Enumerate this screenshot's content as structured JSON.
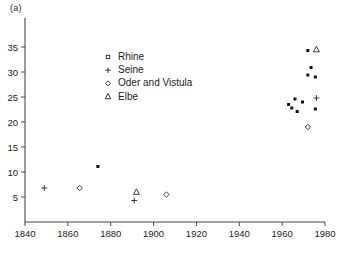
{
  "panel": {
    "label": "(a)"
  },
  "chart_data": {
    "type": "scatter",
    "title": "",
    "xlabel": "",
    "ylabel": "",
    "xlim": [
      1840,
      1980
    ],
    "ylim": [
      0,
      37
    ],
    "xticks": [
      1840,
      1860,
      1880,
      1900,
      1920,
      1940,
      1960,
      1980
    ],
    "yticks": [
      5,
      10,
      15,
      20,
      25,
      30,
      35
    ],
    "grid": false,
    "legend_position": "upper-center-left",
    "legend": [
      {
        "label": "Rhine",
        "marker": "square-open-icon"
      },
      {
        "label": "Seine",
        "marker": "plus-icon"
      },
      {
        "label": "Oder and Vistula",
        "marker": "diamond-open-icon"
      },
      {
        "label": "Elbe",
        "marker": "triangle-open-icon"
      }
    ],
    "series": [
      {
        "name": "Rhine",
        "marker": "square-filled",
        "points": [
          [
            1874,
            11.1
          ],
          [
            1963,
            23.5
          ],
          [
            1964.5,
            22.8
          ],
          [
            1966,
            24.6
          ],
          [
            1967,
            22.1
          ],
          [
            1969.5,
            24.0
          ],
          [
            1972,
            34.3
          ],
          [
            1972,
            29.4
          ],
          [
            1973.5,
            30.9
          ],
          [
            1975.5,
            29.0
          ],
          [
            1975.5,
            22.6
          ]
        ]
      },
      {
        "name": "Seine",
        "marker": "plus",
        "points": [
          [
            1849,
            6.8
          ],
          [
            1891,
            4.3
          ],
          [
            1976,
            24.8
          ]
        ]
      },
      {
        "name": "Oder and Vistula",
        "marker": "diamond-open",
        "points": [
          [
            1865.5,
            6.8
          ],
          [
            1906,
            5.5
          ],
          [
            1972,
            19.0
          ]
        ]
      },
      {
        "name": "Elbe",
        "marker": "triangle-open",
        "points": [
          [
            1892,
            6.0
          ],
          [
            1976,
            34.5
          ]
        ]
      }
    ]
  },
  "colors": {
    "marker_fill": "#111111",
    "marker_stroke": "#222222",
    "axis": "#4a4a4a",
    "text": "#1a1a1a",
    "background": "#ffffff"
  }
}
